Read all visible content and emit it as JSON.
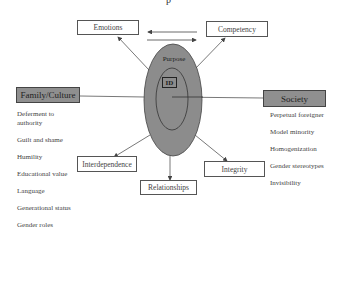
{
  "title_fragment": "p",
  "center": {
    "outer_label": "Purpose",
    "inner_label": "ID"
  },
  "nodes": {
    "emotions": "Emotions",
    "competency": "Competency",
    "interdependence": "Interdependence",
    "relationships": "Relationships",
    "integrity": "Integrity"
  },
  "family_culture": {
    "header": "Family/Culture",
    "items": [
      "Deferment to authority",
      "Guilt and shame",
      "Humility",
      "Educational value",
      "Language",
      "Generational status",
      "Gender roles"
    ]
  },
  "society": {
    "header": "Society",
    "items": [
      "Perpetual foreigner",
      "Model minority",
      "Homogenization",
      "Gender stereotypes",
      "Invisibility"
    ]
  },
  "colors": {
    "ellipse_fill": "#8c8c8c",
    "header_fill": "#8f8f8f",
    "line": "#555555"
  }
}
